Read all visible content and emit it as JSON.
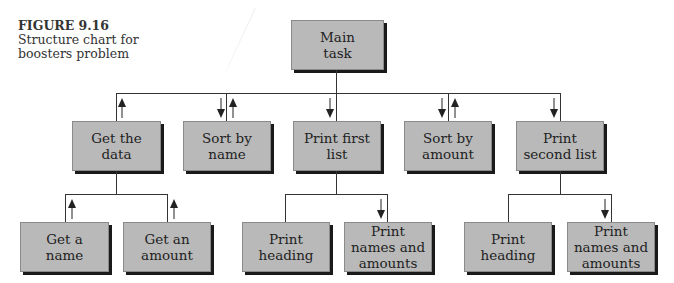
{
  "caption": {
    "figure_label": "FIGURE 9.16",
    "text": "Structure chart for boosters problem"
  },
  "colors": {
    "box_fill": "#b9b9b9",
    "box_shadow": "#1a1a1a",
    "line": "#333333"
  },
  "root": {
    "label": "Main task"
  },
  "level1": [
    {
      "id": "get-the-data",
      "label": "Get the data",
      "arrows": [
        "up"
      ]
    },
    {
      "id": "sort-by-name",
      "label": "Sort by name",
      "arrows": [
        "down",
        "up"
      ]
    },
    {
      "id": "print-first-list",
      "label": "Print first list",
      "arrows": [
        "down"
      ]
    },
    {
      "id": "sort-by-amount",
      "label": "Sort by amount",
      "arrows": [
        "down",
        "up"
      ]
    },
    {
      "id": "print-second-list",
      "label": "Print second list",
      "arrows": [
        "down"
      ]
    }
  ],
  "level2": {
    "get-the-data": [
      {
        "label": "Get a name",
        "arrows": [
          "up"
        ]
      },
      {
        "label": "Get an amount",
        "arrows": [
          "up"
        ]
      }
    ],
    "print-first-list": [
      {
        "label": "Print heading",
        "arrows": []
      },
      {
        "label": "Print names and amounts",
        "arrows": [
          "down"
        ]
      }
    ],
    "print-second-list": [
      {
        "label": "Print heading",
        "arrows": []
      },
      {
        "label": "Print names and amounts",
        "arrows": [
          "down"
        ]
      }
    ]
  }
}
